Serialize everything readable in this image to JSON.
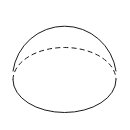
{
  "figure": {
    "title": "Sphere with equatorial cross-section",
    "shape_name": "sphere-diagram",
    "background_color": "#ffffff",
    "stroke_color": "#1a1a1a",
    "stroke_width": 1,
    "canvas": {
      "width": 130,
      "height": 130
    },
    "geometry": {
      "sphere_outline": {
        "name": "sphere-outline",
        "type": "circle-arc",
        "center_x": 64.5,
        "center_y": 57.5,
        "radius": 52,
        "start_angle_deg": 170,
        "end_angle_deg": 10,
        "sweep": "upper",
        "style": "solid"
      },
      "equator_back": {
        "name": "equator-back-arc",
        "type": "ellipse-arc",
        "center_x": 64.5,
        "center_y": 80,
        "radius_x": 51.5,
        "radius_y": 32.5,
        "half": "upper",
        "style": "dashed",
        "dash_pattern": "5 3.2"
      },
      "equator_front": {
        "name": "equator-front-arc",
        "type": "ellipse-arc",
        "center_x": 64.5,
        "center_y": 80,
        "radius_x": 51.5,
        "radius_y": 32.5,
        "half": "lower",
        "style": "solid"
      },
      "junction_points": [
        {
          "name": "left-cusp",
          "x": 13,
          "y": 80
        },
        {
          "name": "right-cusp",
          "x": 116,
          "y": 80
        }
      ]
    },
    "paths": {
      "sphere_outline_d": "M 13.0 71.0 A 52 52 0 0 1 116.0 71.0",
      "equator_back_d": "M 13.0 80.0 A 51.5 32.5 0 0 1 116.0 80.0",
      "equator_front_d": "M 13.0 80.0 A 51.5 32.5 0 0 0 116.0 80.0"
    }
  }
}
